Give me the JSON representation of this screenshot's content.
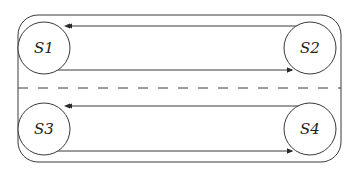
{
  "diagram": {
    "type": "state-diagram",
    "colors": {
      "stroke": "#3a3a3a",
      "background": "#ffffff",
      "text": "#222222"
    },
    "container": {
      "x": 18,
      "y": 15,
      "width": 323,
      "height": 147,
      "corner_radius": 20
    },
    "divider": {
      "y": 88,
      "style": "dashed"
    },
    "states": [
      {
        "id": "S1",
        "label": "S1",
        "cx": 44,
        "cy": 48,
        "r": 26
      },
      {
        "id": "S2",
        "label": "S2",
        "cx": 310,
        "cy": 48,
        "r": 26
      },
      {
        "id": "S3",
        "label": "S3",
        "cx": 44,
        "cy": 129,
        "r": 26
      },
      {
        "id": "S4",
        "label": "S4",
        "cx": 310,
        "cy": 129,
        "r": 26
      }
    ],
    "transitions": [
      {
        "from": "S2",
        "to": "S1",
        "y": 26
      },
      {
        "from": "S1",
        "to": "S2",
        "y": 70
      },
      {
        "from": "S4",
        "to": "S3",
        "y": 106
      },
      {
        "from": "S3",
        "to": "S4",
        "y": 151
      }
    ]
  }
}
